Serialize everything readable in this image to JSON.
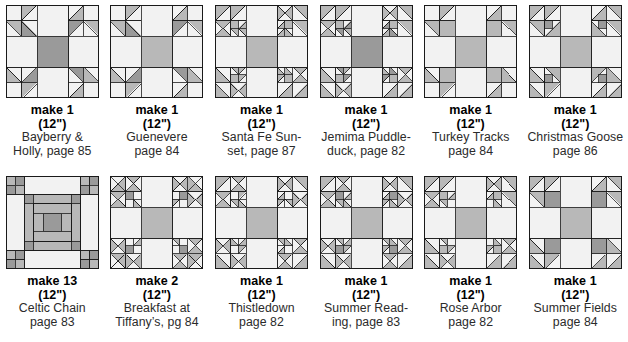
{
  "page": {
    "block_size_label": "(12\")",
    "background": "#ffffff",
    "palette": {
      "light": "#f2f2f2",
      "medium": "#b8b8b8",
      "dark": "#9a9a9a",
      "outline": "#1a1a1a",
      "text": "#000000",
      "name_text": "#2b2b2b"
    }
  },
  "blocks": [
    {
      "id": "bayberry-holly",
      "make": "make 1",
      "size": "(12\")",
      "name_lines": [
        "Bayberry &",
        "Holly, page 85"
      ],
      "pattern": "sawtooth-star-corners",
      "row": 1,
      "col": 1
    },
    {
      "id": "guenevere",
      "make": "make 1",
      "size": "(12\")",
      "name_lines": [
        "Guenevere",
        "page 84"
      ],
      "pattern": "guenevere",
      "row": 1,
      "col": 2
    },
    {
      "id": "santa-fe-sunset",
      "make": "make 1",
      "size": "(12\")",
      "name_lines": [
        "Santa Fe Sun-",
        "set, page 87"
      ],
      "pattern": "santa-fe",
      "row": 1,
      "col": 3
    },
    {
      "id": "jemima-puddleduck",
      "make": "make 1",
      "size": "(12\")",
      "name_lines": [
        "Jemima Puddle-",
        "duck, page 82"
      ],
      "pattern": "jemima",
      "row": 1,
      "col": 4
    },
    {
      "id": "turkey-tracks",
      "make": "make 1",
      "size": "(12\")",
      "name_lines": [
        "Turkey Tracks",
        "page 84"
      ],
      "pattern": "turkey-tracks",
      "row": 1,
      "col": 5
    },
    {
      "id": "christmas-goose",
      "make": "make 1",
      "size": "(12\")",
      "name_lines": [
        "Christmas Goose",
        "page 86"
      ],
      "pattern": "christmas-goose",
      "row": 1,
      "col": 6
    },
    {
      "id": "celtic-chain",
      "make": "make 13",
      "size": "(12\")",
      "name_lines": [
        "Celtic Chain",
        "page 83"
      ],
      "pattern": "celtic-chain",
      "row": 2,
      "col": 1
    },
    {
      "id": "breakfast-at-tiffanys",
      "make": "make 2",
      "size": "(12\")",
      "name_lines": [
        "Breakfast at",
        "Tiffany’s, pg 84"
      ],
      "pattern": "breakfast",
      "row": 2,
      "col": 2
    },
    {
      "id": "thistledown",
      "make": "make 1",
      "size": "(12\")",
      "name_lines": [
        "Thistledown",
        "page 82"
      ],
      "pattern": "thistledown",
      "row": 2,
      "col": 3
    },
    {
      "id": "summer-reading",
      "make": "make 1",
      "size": "(12\")",
      "name_lines": [
        "Summer Read-",
        "ing, page 83"
      ],
      "pattern": "summer-reading",
      "row": 2,
      "col": 4
    },
    {
      "id": "rose-arbor",
      "make": "make 1",
      "size": "(12\")",
      "name_lines": [
        "Rose Arbor",
        "page 82"
      ],
      "pattern": "rose-arbor",
      "row": 2,
      "col": 5
    },
    {
      "id": "summer-fields",
      "make": "make 1",
      "size": "(12\")",
      "name_lines": [
        "Summer Fields",
        "page 84"
      ],
      "pattern": "summer-fields",
      "row": 2,
      "col": 6
    }
  ]
}
